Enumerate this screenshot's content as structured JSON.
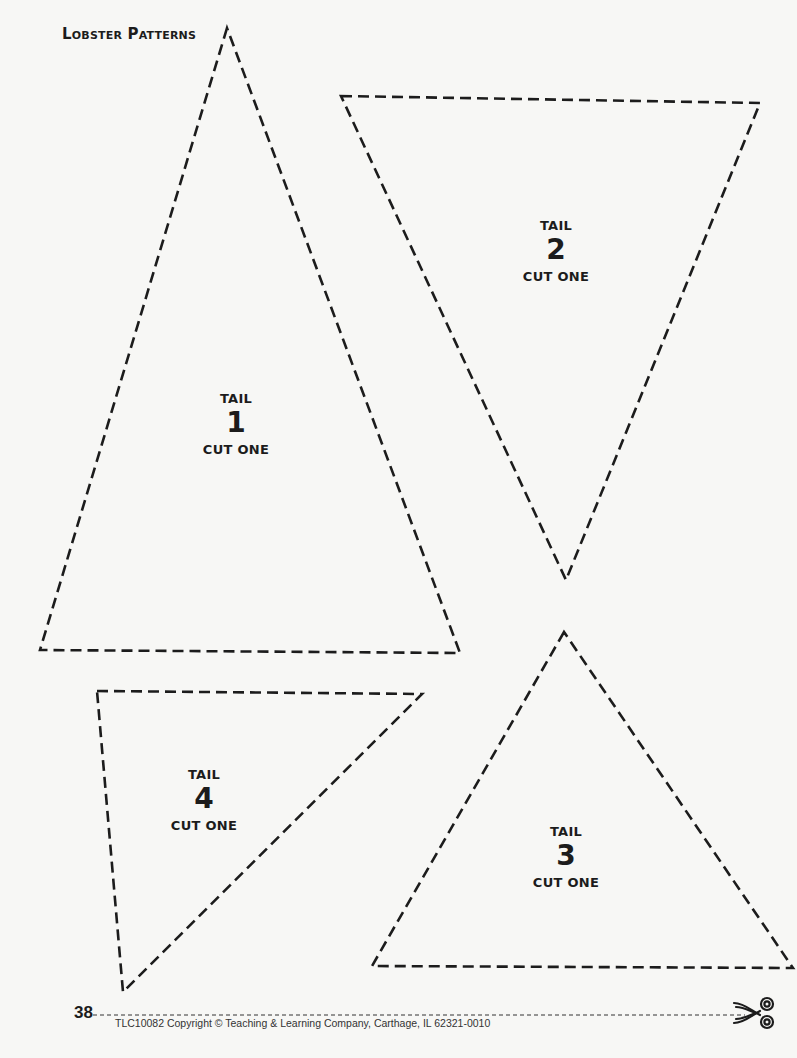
{
  "page": {
    "title": "Lobster Patterns",
    "page_number": "38",
    "copyright": "TLC10082 Copyright © Teaching & Learning Company, Carthage, IL  62321-0010"
  },
  "patterns": [
    {
      "id": "tail-1",
      "tail_label": "TAIL",
      "number": "1",
      "instruction": "CUT ONE"
    },
    {
      "id": "tail-2",
      "tail_label": "TAIL",
      "number": "2",
      "instruction": "CUT ONE"
    },
    {
      "id": "tail-3",
      "tail_label": "TAIL",
      "number": "3",
      "instruction": "CUT ONE"
    },
    {
      "id": "tail-4",
      "tail_label": "TAIL",
      "number": "4",
      "instruction": "CUT ONE"
    }
  ],
  "footer": {
    "cut_line_icon": "scissors-icon"
  },
  "colors": {
    "ink": "#1c1c1c",
    "paper": "#f7f7f5"
  }
}
